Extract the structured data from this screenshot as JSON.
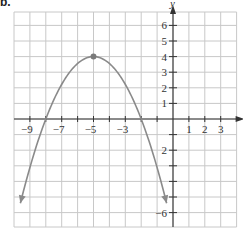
{
  "part_label": "b.",
  "chart_data": {
    "type": "line",
    "title": "",
    "xlabel": "x",
    "ylabel": "y",
    "xlim": [
      -10,
      4
    ],
    "ylim": [
      -7,
      7
    ],
    "grid": true,
    "x_tick_labels": [
      {
        "value": -9,
        "label": "−9"
      },
      {
        "value": -7,
        "label": "−7"
      },
      {
        "value": -5,
        "label": "−5"
      },
      {
        "value": -3,
        "label": "−3"
      },
      {
        "value": 1,
        "label": "1"
      },
      {
        "value": 2,
        "label": "2"
      },
      {
        "value": 3,
        "label": "3"
      }
    ],
    "y_tick_labels": [
      {
        "value": 6,
        "label": "6"
      },
      {
        "value": 5,
        "label": "5"
      },
      {
        "value": 4,
        "label": "4"
      },
      {
        "value": 3,
        "label": "3"
      },
      {
        "value": 2,
        "label": "2"
      },
      {
        "value": 1,
        "label": "1"
      },
      {
        "value": -2,
        "label": "2"
      },
      {
        "value": -6,
        "label": "−6"
      }
    ],
    "series": [
      {
        "name": "parabola",
        "description": "downward-opening parabola with vertex (-5, 4), x-intercepts -8 and -2, arrows at both ends",
        "vertex": [
          -5,
          4
        ],
        "x_intercepts": [
          -8,
          -2
        ],
        "x": [
          -9.6,
          -9,
          -8,
          -7,
          -6,
          -5,
          -4,
          -3,
          -2,
          -1,
          -0.4
        ],
        "values": [
          -5.4,
          -3.1,
          0,
          2.2,
          3.6,
          4,
          3.6,
          2.2,
          0,
          -3.1,
          -5.4
        ]
      }
    ],
    "highlighted_points": [
      {
        "x": -5,
        "y": 4,
        "label": "vertex"
      }
    ],
    "colors": {
      "curve": "#8a8a8a",
      "grid": "#c8c8c8",
      "axis": "#333333",
      "point": "#7a7a7a"
    }
  }
}
